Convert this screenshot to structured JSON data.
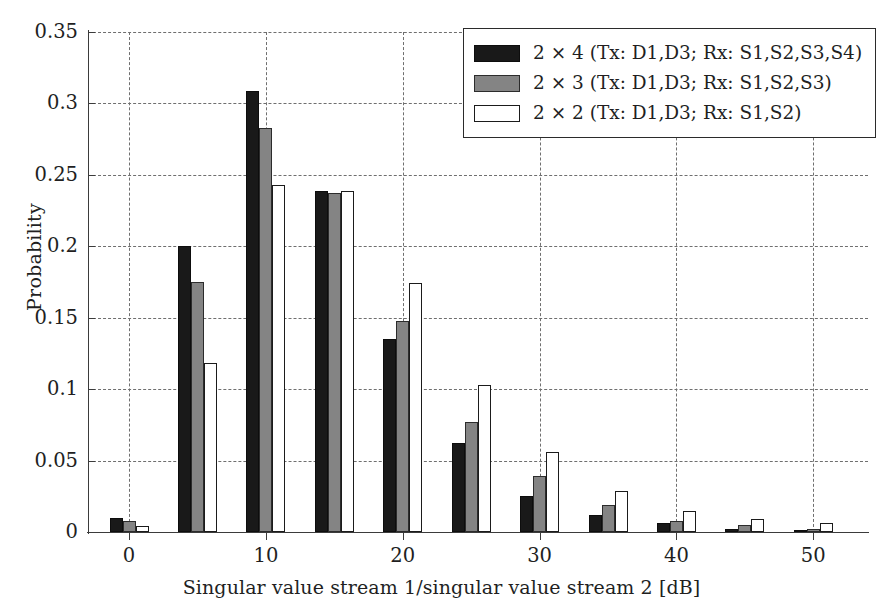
{
  "chart_data": {
    "type": "bar",
    "title": "",
    "xlabel": "Singular value stream 1/singular value stream 2 [dB]",
    "ylabel": "Probability",
    "x": [
      0,
      5,
      10,
      15,
      20,
      25,
      30,
      35,
      40,
      45,
      50
    ],
    "categories": [
      "0",
      "5",
      "10",
      "15",
      "20",
      "25",
      "30",
      "35",
      "40",
      "45",
      "50"
    ],
    "xtick_labels": [
      "0",
      "10",
      "20",
      "30",
      "40",
      "50"
    ],
    "xtick_values": [
      0,
      10,
      20,
      30,
      40,
      50
    ],
    "xlim": [
      -3,
      54
    ],
    "ylim": [
      0,
      0.35
    ],
    "ytick_labels": [
      "0",
      "0.05",
      "0.1",
      "0.15",
      "0.2",
      "0.25",
      "0.3",
      "0.35"
    ],
    "ytick_values": [
      0,
      0.05,
      0.1,
      0.15,
      0.2,
      0.25,
      0.3,
      0.35
    ],
    "grid": "dashed-both",
    "legend_position": "top-right",
    "series": [
      {
        "name": "2 × 4 (Tx: D1,D3; Rx: S1,S2,S3,S4)",
        "color": "#191919",
        "values": [
          0.01,
          0.2,
          0.309,
          0.239,
          0.135,
          0.062,
          0.025,
          0.012,
          0.006,
          0.002,
          0.001
        ]
      },
      {
        "name": "2 × 3 (Tx: D1,D3; Rx: S1,S2,S3)",
        "color": "#848484",
        "values": [
          0.008,
          0.175,
          0.283,
          0.237,
          0.148,
          0.077,
          0.039,
          0.019,
          0.008,
          0.005,
          0.002
        ]
      },
      {
        "name": "2 × 2 (Tx: D1,D3; Rx: S1,S2)",
        "color": "#ffffff",
        "values": [
          0.004,
          0.118,
          0.243,
          0.239,
          0.174,
          0.103,
          0.056,
          0.029,
          0.015,
          0.009,
          0.006
        ]
      }
    ]
  },
  "legend": {
    "items": [
      {
        "label": "2 × 4 (Tx: D1,D3; Rx: S1,S2,S3,S4)",
        "swatch": "black-filled-swatch"
      },
      {
        "label": "2 × 3 (Tx: D1,D3; Rx: S1,S2,S3)",
        "swatch": "gray-filled-swatch"
      },
      {
        "label": "2 × 2 (Tx: D1,D3; Rx: S1,S2)",
        "swatch": "white-outline-swatch"
      }
    ]
  }
}
